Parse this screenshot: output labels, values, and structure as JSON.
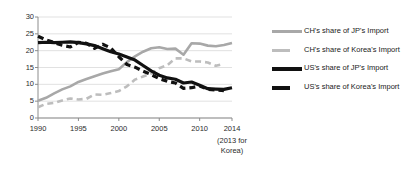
{
  "chart_data": {
    "type": "line",
    "title": "",
    "xlabel": "",
    "ylabel": "",
    "xlim": [
      1990,
      2014
    ],
    "ylim": [
      0,
      30
    ],
    "ytick_step": 5,
    "grid": true,
    "legend_position": "right",
    "x_tick_labels": [
      "1990",
      "1995",
      "2000",
      "2005",
      "2010",
      "2014"
    ],
    "x_tick_values": [
      1990,
      1995,
      2000,
      2005,
      2010,
      2014
    ],
    "x_axis_note": "(2013 for\nKorea)",
    "x_axis_note_line1": "(2013 for",
    "x_axis_note_line2": "Korea)",
    "y_tick_labels": [
      "0",
      "5",
      "10",
      "15",
      "20",
      "25",
      "30"
    ],
    "y_tick_values": [
      0,
      5,
      10,
      15,
      20,
      25,
      30
    ],
    "colors": {
      "ch_jp": "#a8a8a8",
      "ch_korea": "#bdbdbd",
      "us_jp": "#111111",
      "us_korea": "#111111",
      "gridline": "#d9d9d9",
      "axis": "#8c8c8c",
      "text": "#1a1a1a"
    },
    "series": [
      {
        "name": "CH's share of JP's Import",
        "key": "ch_jp",
        "style": "solid",
        "color": "#a8a8a8",
        "x": [
          1990,
          1991,
          1992,
          1993,
          1994,
          1995,
          1996,
          1997,
          1998,
          1999,
          2000,
          2001,
          2002,
          2003,
          2004,
          2005,
          2006,
          2007,
          2008,
          2009,
          2010,
          2011,
          2012,
          2013,
          2014
        ],
        "values": [
          5.1,
          6.0,
          7.3,
          8.5,
          9.4,
          10.7,
          11.6,
          12.4,
          13.2,
          13.9,
          14.5,
          16.6,
          18.3,
          19.7,
          20.7,
          21.0,
          20.5,
          20.6,
          18.8,
          22.2,
          22.1,
          21.5,
          21.3,
          21.7,
          22.3
        ]
      },
      {
        "name": "CH's share of Korea's Import",
        "key": "ch_korea",
        "style": "dashed",
        "color": "#bdbdbd",
        "x": [
          1990,
          1991,
          1992,
          1993,
          1994,
          1995,
          1996,
          1997,
          1998,
          1999,
          2000,
          2001,
          2002,
          2003,
          2004,
          2005,
          2006,
          2007,
          2008,
          2009,
          2010,
          2011,
          2012,
          2013
        ],
        "values": [
          3.2,
          4.2,
          4.5,
          5.2,
          5.8,
          5.5,
          5.7,
          7.0,
          6.9,
          7.4,
          8.0,
          9.4,
          11.4,
          12.3,
          13.2,
          14.8,
          15.7,
          17.7,
          17.7,
          16.8,
          16.8,
          16.5,
          15.5,
          16.1
        ]
      },
      {
        "name": "US's share of JP's Import",
        "key": "us_jp",
        "style": "solid",
        "color": "#111111",
        "x": [
          1990,
          1991,
          1992,
          1993,
          1994,
          1995,
          1996,
          1997,
          1998,
          1999,
          2000,
          2001,
          2002,
          2003,
          2004,
          2005,
          2006,
          2007,
          2008,
          2009,
          2010,
          2011,
          2012,
          2013,
          2014
        ],
        "values": [
          22.4,
          22.5,
          22.4,
          22.5,
          22.6,
          22.4,
          22.0,
          21.5,
          20.6,
          19.7,
          19.0,
          18.1,
          17.2,
          15.6,
          14.0,
          12.7,
          11.9,
          11.5,
          10.4,
          10.7,
          9.7,
          8.7,
          8.6,
          8.5,
          9.0
        ]
      },
      {
        "name": "US's share of Korea's Import",
        "key": "us_korea",
        "style": "dashed",
        "color": "#111111",
        "x": [
          1990,
          1991,
          1992,
          1993,
          1994,
          1995,
          1996,
          1997,
          1998,
          1999,
          2000,
          2001,
          2002,
          2003,
          2004,
          2005,
          2006,
          2007,
          2008,
          2009,
          2010,
          2011,
          2012,
          2013
        ],
        "values": [
          24.3,
          23.2,
          22.4,
          21.6,
          21.1,
          22.5,
          22.2,
          20.7,
          21.9,
          20.8,
          18.2,
          15.9,
          15.1,
          13.9,
          12.9,
          11.7,
          10.9,
          10.4,
          8.8,
          9.0,
          9.5,
          8.5,
          8.3,
          8.1
        ]
      }
    ]
  },
  "legend": {
    "items": [
      {
        "label": "CH's share of JP's Import",
        "swatch": "sw-long-gray",
        "name": "legend-item-ch-jp"
      },
      {
        "label": "CH's share of Korea's Import",
        "swatch": "sw-short-gray",
        "name": "legend-item-ch-korea"
      },
      {
        "label": "US's share of JP's Import",
        "swatch": "sw-long-black",
        "name": "legend-item-us-jp"
      },
      {
        "label": "US's share of Korea's Import",
        "swatch": "sw-short-black",
        "name": "legend-item-us-korea"
      }
    ]
  }
}
